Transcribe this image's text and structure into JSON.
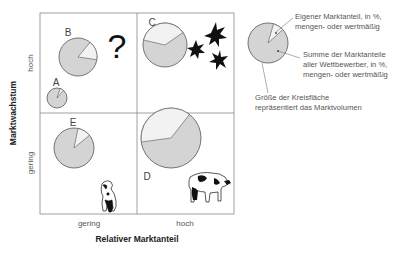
{
  "axes": {
    "y_title": "Marktwachstum",
    "y_ticks": [
      "hoch",
      "gering"
    ],
    "x_title": "Relativer Marktanteil",
    "x_ticks": [
      "gering",
      "hoch"
    ]
  },
  "quadrants": [
    {
      "position": "top-left",
      "symbol": "?",
      "symbol_name": "question-mark"
    },
    {
      "position": "top-right",
      "symbol": "stars",
      "symbol_name": "star-icons"
    },
    {
      "position": "bottom-left",
      "symbol": "dog",
      "symbol_name": "dog-illustration"
    },
    {
      "position": "bottom-right",
      "symbol": "cow",
      "symbol_name": "cow-illustration"
    }
  ],
  "units": [
    {
      "label": "A",
      "cx": 57,
      "cy": 98,
      "r": 10,
      "share_pct": 8
    },
    {
      "label": "B",
      "cx": 78,
      "cy": 57,
      "r": 19,
      "share_pct": 15
    },
    {
      "label": "C",
      "cx": 165,
      "cy": 45,
      "r": 22,
      "share_pct": 38
    },
    {
      "label": "D",
      "cx": 171,
      "cy": 138,
      "r": 30,
      "share_pct": 40
    },
    {
      "label": "E",
      "cx": 74,
      "cy": 148,
      "r": 20,
      "share_pct": 10
    }
  ],
  "legend": {
    "own_share": [
      "Eigener Marktanteil, in %,",
      "mengen- oder wertmäßig"
    ],
    "competitors_share": [
      "Summe der Marktanteile",
      "aller Wettbewerber, in %,",
      "mengen- oder wertmäßig"
    ],
    "circle_size": [
      "Größe der Kreisfläche",
      "repräsentiert das Marktvolumen"
    ]
  },
  "colors": {
    "competitors_fill": "#d4d4d4",
    "own_fill": "#f2f2f2",
    "stroke": "#555555",
    "grid": "#888888"
  }
}
